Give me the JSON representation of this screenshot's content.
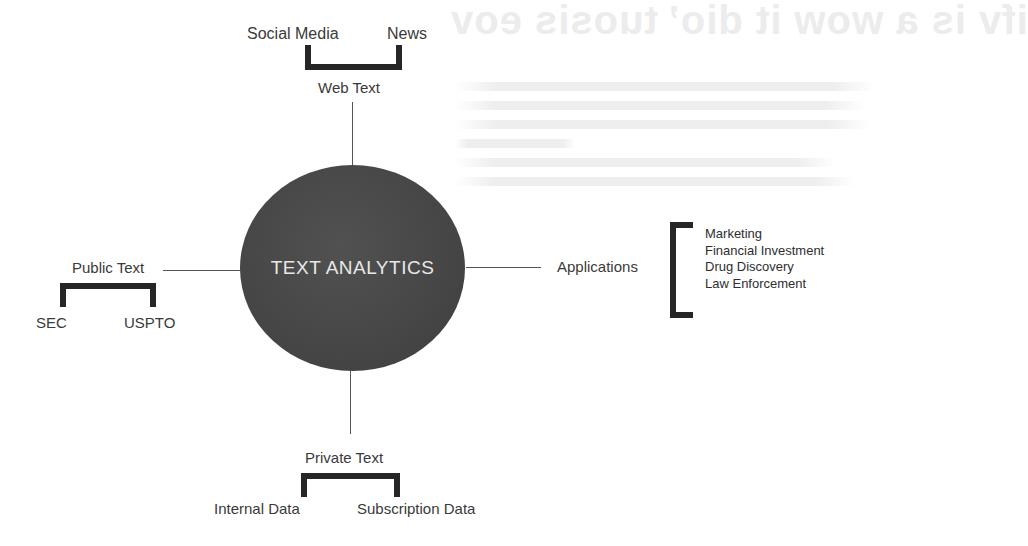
{
  "background_text": {
    "heading": "ifv is a wow it dio’ tuosis eov"
  },
  "hub": {
    "label": "TEXT ANALYTICS",
    "fill_color": "#474747",
    "text_color": "#e8e8e8"
  },
  "branches": {
    "top": {
      "label": "Web Text",
      "children": [
        "Social Media",
        "News"
      ]
    },
    "left": {
      "label": "Public Text",
      "children": [
        "SEC",
        "USPTO"
      ]
    },
    "bottom": {
      "label": "Private Text",
      "children": [
        "Internal Data",
        "Subscription Data"
      ]
    },
    "right": {
      "label": "Applications",
      "children": [
        "Marketing",
        "Financial Investment",
        "Drug Discovery",
        "Law Enforcement"
      ]
    }
  },
  "colors": {
    "bracket": "#262626",
    "connector": "#555555",
    "label_text": "#3a3a3a"
  }
}
